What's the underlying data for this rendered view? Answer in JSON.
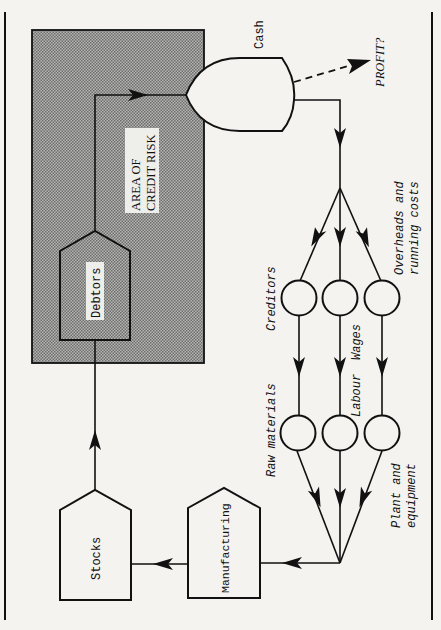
{
  "diagram": {
    "title": "",
    "colors": {
      "background": "#f4f3f0",
      "ink": "#111111",
      "shaded_area": "#9a9a9a",
      "label_box": "#eeeeea"
    },
    "region": {
      "label_line1": "AREA OF",
      "label_line2": "CREDIT RISK"
    },
    "nodes": {
      "cash": "Cash",
      "profit": "PROFIT?",
      "debtors": "Debtors",
      "stocks": "Stocks",
      "manufacturing": "Manufacturing",
      "creditors": "Creditors",
      "wages": "Wages",
      "overheads_line1": "Overheads and",
      "overheads_line2": "running costs",
      "raw_materials": "Raw materials",
      "labour": "Labour",
      "plant_line1": "Plant and",
      "plant_line2": "equipment"
    },
    "edges": [
      {
        "from": "manufacturing",
        "to": "stocks",
        "style": "solid"
      },
      {
        "from": "stocks",
        "to": "debtors",
        "style": "solid"
      },
      {
        "from": "debtors",
        "to": "cash",
        "style": "solid"
      },
      {
        "from": "cash",
        "to": "profit",
        "style": "dashed"
      },
      {
        "from": "cash",
        "to": "creditors",
        "style": "solid"
      },
      {
        "from": "cash",
        "to": "wages",
        "style": "solid"
      },
      {
        "from": "cash",
        "to": "overheads",
        "style": "solid"
      },
      {
        "from": "creditors",
        "to": "raw_materials",
        "style": "solid"
      },
      {
        "from": "wages",
        "to": "labour",
        "style": "solid"
      },
      {
        "from": "overheads",
        "to": "plant_equipment",
        "style": "solid"
      },
      {
        "from": "raw_materials",
        "to": "manufacturing",
        "style": "solid"
      },
      {
        "from": "labour",
        "to": "manufacturing",
        "style": "solid"
      },
      {
        "from": "plant_equipment",
        "to": "manufacturing",
        "style": "solid"
      }
    ]
  }
}
